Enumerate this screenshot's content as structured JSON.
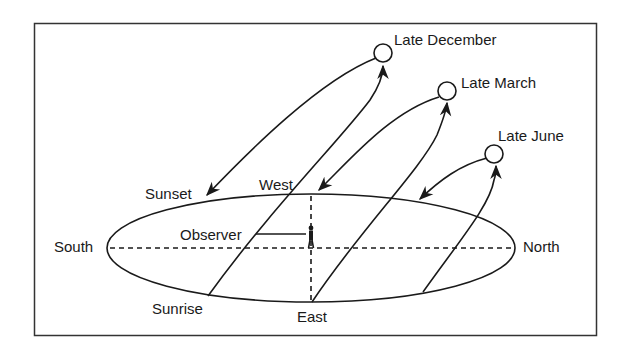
{
  "diagram": {
    "directions": {
      "south": "South",
      "north": "North",
      "east": "East",
      "west": "West"
    },
    "events": {
      "sunrise": "Sunrise",
      "sunset": "Sunset"
    },
    "observer_label": "Observer",
    "sun_positions": [
      {
        "label": "Late December"
      },
      {
        "label": "Late March"
      },
      {
        "label": "Late June"
      }
    ],
    "colors": {
      "line": "#1a1a1a",
      "background": "#ffffff"
    }
  }
}
